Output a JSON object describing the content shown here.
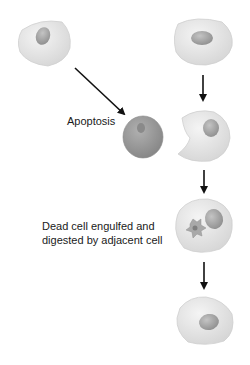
{
  "diagram": {
    "type": "apoptosis-process",
    "labels": {
      "apoptosis": "Apoptosis",
      "engulf_line1": "Dead cell engulfed and",
      "engulf_line2": "digested by adjacent cell"
    },
    "nodes": [
      {
        "id": "healthy-cell-left",
        "desc": "Healthy cell undergoing apoptosis"
      },
      {
        "id": "healthy-cell-right",
        "desc": "Adjacent healthy cell"
      },
      {
        "id": "apoptotic-cell",
        "desc": "Shrunken dead cell"
      },
      {
        "id": "engulfing-cell",
        "desc": "Adjacent cell extending to engulf"
      },
      {
        "id": "digesting-cell",
        "desc": "Cell containing engulfed dead cell"
      },
      {
        "id": "recovered-cell",
        "desc": "Adjacent cell after digestion"
      }
    ],
    "colors": {
      "cell_fill": "#e6e6e6",
      "cell_edge": "#c8c8c8",
      "nucleus": "#a8a8a8",
      "dead_cell": "#9a9a9a",
      "arrow": "#111111"
    }
  }
}
